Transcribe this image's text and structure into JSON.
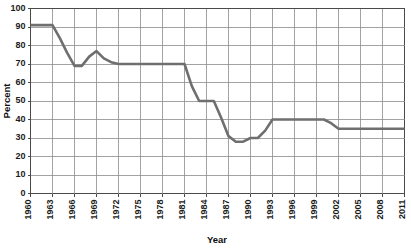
{
  "chart_data": {
    "type": "line",
    "title": "",
    "xlabel": "Year",
    "ylabel": "Percent",
    "xlim": [
      1960,
      2011
    ],
    "ylim": [
      0,
      100
    ],
    "grid": true,
    "legend": false,
    "y_ticks": [
      0,
      10,
      20,
      30,
      40,
      50,
      60,
      70,
      80,
      90,
      100
    ],
    "x_ticks": [
      1960,
      1963,
      1966,
      1969,
      1972,
      1975,
      1978,
      1981,
      1984,
      1987,
      1990,
      1993,
      1996,
      1999,
      2002,
      2005,
      2008,
      2011
    ],
    "x_tick_labels": [
      "1960",
      "1963",
      "1966",
      "1969",
      "1972",
      "1975",
      "1978",
      "1981",
      "1984",
      "1987",
      "1990",
      "1993",
      "1996",
      "1999",
      "2002",
      "2005",
      "2008",
      "2011"
    ],
    "y_tick_labels": [
      "0",
      "10",
      "20",
      "30",
      "40",
      "50",
      "60",
      "70",
      "80",
      "90",
      "100"
    ],
    "series": [
      {
        "name": "Percent",
        "color": "#6f6f6f",
        "x": [
          1960,
          1961,
          1962,
          1963,
          1964,
          1965,
          1966,
          1967,
          1968,
          1969,
          1970,
          1971,
          1972,
          1973,
          1974,
          1975,
          1976,
          1977,
          1978,
          1979,
          1980,
          1981,
          1982,
          1983,
          1984,
          1985,
          1986,
          1987,
          1988,
          1989,
          1990,
          1991,
          1992,
          1993,
          1994,
          1995,
          1996,
          1997,
          1998,
          1999,
          2000,
          2001,
          2002,
          2003,
          2004,
          2005,
          2006,
          2007,
          2008,
          2009,
          2010,
          2011
        ],
        "values": [
          91,
          91,
          91,
          91,
          84,
          76,
          69,
          69,
          74,
          77,
          73,
          71,
          70,
          70,
          70,
          70,
          70,
          70,
          70,
          70,
          70,
          70,
          58,
          50,
          50,
          50,
          41,
          31,
          28,
          28,
          30,
          30,
          34,
          40,
          40,
          40,
          40,
          40,
          40,
          40,
          40,
          38,
          35,
          35,
          35,
          35,
          35,
          35,
          35,
          35,
          35,
          35
        ]
      }
    ],
    "notes": {
      "start_plateau": 91,
      "first_drop_to": 69,
      "local_peak": 77,
      "mid_plateau": 70,
      "second_plateau": 50,
      "trough": 28,
      "recovery_plateau": 40,
      "final_plateau": 35
    }
  }
}
